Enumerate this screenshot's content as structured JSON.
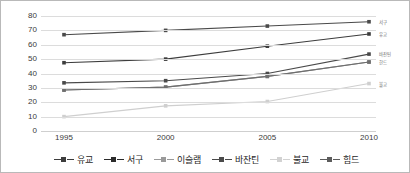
{
  "chart_data": {
    "type": "line",
    "title": "",
    "subtitle": "",
    "xlabel": "",
    "ylabel": "",
    "categories": [
      "1995",
      "2000",
      "2005",
      "2010"
    ],
    "x_tick_labels": [
      "1995",
      "2000",
      "2005",
      "2010"
    ],
    "y_tick_labels": [
      "0",
      "10",
      "20",
      "30",
      "40",
      "50",
      "60",
      "70",
      "80"
    ],
    "y_ticks": [
      0,
      10,
      20,
      30,
      40,
      50,
      60,
      70,
      80
    ],
    "ylim": [
      0,
      80
    ],
    "grid": "horizontal",
    "legend_position": "bottom",
    "marker": "square",
    "series": [
      {
        "name": "유교",
        "values": [
          47.5,
          50.0,
          59.0,
          67.5
        ],
        "color": "#3d3d3d",
        "end_label": "유교"
      },
      {
        "name": "서구",
        "values": [
          67.0,
          70.0,
          73.0,
          76.0
        ],
        "color": "#4a4a4a",
        "end_label": "서구"
      },
      {
        "name": "이슬램",
        "values": [
          28.5,
          30.5,
          38.0,
          48.0
        ],
        "color": "#8c8c8c",
        "end_label": ""
      },
      {
        "name": "바잔틴",
        "values": [
          33.5,
          35.0,
          40.0,
          53.5
        ],
        "color": "#4a4a4a",
        "end_label": "바잔틴"
      },
      {
        "name": "불교",
        "values": [
          10.0,
          17.5,
          20.5,
          33.0
        ],
        "color": "#cfcfcf",
        "end_label": "불교"
      },
      {
        "name": "힘드",
        "values": [
          28.5,
          30.5,
          38.0,
          48.0
        ],
        "color": "#6e6e6e",
        "end_label": "한드"
      }
    ]
  },
  "legend": {
    "items": [
      {
        "label": "유교",
        "color": "#3d3d3d"
      },
      {
        "label": "서구",
        "color": "#2b2b2b"
      },
      {
        "label": "이슬램",
        "color": "#9a9a9a"
      },
      {
        "label": "바잔틴",
        "color": "#4a4a4a"
      },
      {
        "label": "불교",
        "color": "#d2d2d2"
      },
      {
        "label": "힘드",
        "color": "#5c5c5c"
      }
    ]
  },
  "end_labels": [
    {
      "label": "서구",
      "value": 76.0,
      "color": "#6e6e6e"
    },
    {
      "label": "유교",
      "value": 67.5,
      "color": "#6e6e6e"
    },
    {
      "label": "바잔틴",
      "value": 53.5,
      "color": "#6e6e6e"
    },
    {
      "label": "한드",
      "value": 48.0,
      "color": "#6e6e6e"
    },
    {
      "label": "불교",
      "value": 33.0,
      "color": "#6e6e6e"
    }
  ],
  "colors": {
    "grid": "#dcdcdc",
    "border": "#b9b9b9",
    "axis_text": "#3a3a3a",
    "legend_text": "#1f1f1f",
    "background": "#ffffff"
  }
}
